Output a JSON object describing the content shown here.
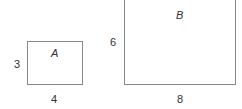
{
  "figure": {
    "rectangles": [
      {
        "name": "A",
        "width_label": "4",
        "height_label": "3"
      },
      {
        "name": "B",
        "width_label": "8",
        "height_label": "6"
      }
    ]
  }
}
